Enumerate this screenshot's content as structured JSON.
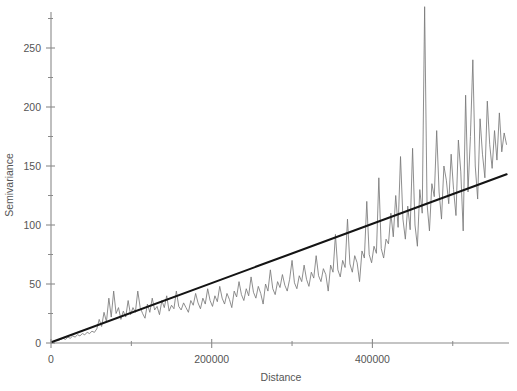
{
  "chart_data": {
    "type": "line",
    "title": "",
    "subtitle": "",
    "xlabel": "Distance",
    "ylabel": "Semivariance",
    "xlim": [
      0,
      570000
    ],
    "ylim": [
      0,
      285
    ],
    "grid": false,
    "legend_position": "none",
    "x_ticks_major": [
      0,
      200000,
      400000
    ],
    "x_tick_labels_major": [
      "0",
      "200000",
      "400000"
    ],
    "x_ticks_minor": [
      100000,
      300000,
      500000
    ],
    "y_ticks_major": [
      0,
      50,
      100,
      150,
      200,
      250
    ],
    "y_tick_labels_major": [
      "0",
      "50",
      "100",
      "150",
      "200",
      "250"
    ],
    "y_ticks_minor": [
      25,
      75,
      125,
      175,
      225,
      275
    ],
    "series": [
      {
        "name": "Empirical semivariogram",
        "type": "line",
        "color": "#7a7a7a",
        "x": [
          3000,
          6000,
          9000,
          12000,
          15000,
          18000,
          21000,
          24000,
          27000,
          30000,
          33000,
          36000,
          39000,
          42000,
          45000,
          48000,
          51000,
          54000,
          57000,
          60000,
          63000,
          66000,
          69000,
          72000,
          75000,
          78000,
          81000,
          84000,
          87000,
          90000,
          93000,
          96000,
          99000,
          102000,
          105000,
          108000,
          111000,
          114000,
          117000,
          120000,
          123000,
          126000,
          129000,
          132000,
          135000,
          138000,
          141000,
          144000,
          147000,
          150000,
          153000,
          156000,
          159000,
          162000,
          165000,
          168000,
          171000,
          174000,
          177000,
          180000,
          183000,
          186000,
          189000,
          192000,
          195000,
          198000,
          201000,
          204000,
          207000,
          210000,
          213000,
          216000,
          219000,
          222000,
          225000,
          228000,
          231000,
          234000,
          237000,
          240000,
          243000,
          246000,
          249000,
          252000,
          255000,
          258000,
          261000,
          264000,
          267000,
          270000,
          273000,
          276000,
          279000,
          282000,
          285000,
          288000,
          291000,
          294000,
          297000,
          300000,
          303000,
          306000,
          309000,
          312000,
          315000,
          318000,
          321000,
          324000,
          327000,
          330000,
          333000,
          336000,
          339000,
          342000,
          345000,
          348000,
          351000,
          354000,
          357000,
          360000,
          363000,
          366000,
          369000,
          372000,
          375000,
          378000,
          381000,
          384000,
          387000,
          390000,
          393000,
          396000,
          399000,
          402000,
          405000,
          408000,
          411000,
          414000,
          417000,
          420000,
          423000,
          426000,
          429000,
          432000,
          435000,
          438000,
          441000,
          444000,
          447000,
          450000,
          453000,
          456000,
          459000,
          462000,
          465000,
          468000,
          471000,
          474000,
          477000,
          480000,
          483000,
          486000,
          489000,
          492000,
          495000,
          498000,
          501000,
          504000,
          507000,
          510000,
          513000,
          516000,
          519000,
          522000,
          525000,
          528000,
          531000,
          534000,
          537000,
          540000,
          543000,
          546000,
          549000,
          552000,
          555000,
          558000,
          561000,
          564000,
          567000
        ],
        "y": [
          1,
          2,
          2,
          3,
          4,
          3,
          5,
          4,
          6,
          5,
          7,
          6,
          8,
          7,
          9,
          8,
          10,
          9,
          12,
          20,
          14,
          26,
          18,
          38,
          22,
          44,
          25,
          30,
          20,
          27,
          22,
          36,
          24,
          30,
          26,
          44,
          30,
          25,
          21,
          33,
          26,
          38,
          28,
          31,
          24,
          36,
          30,
          40,
          27,
          32,
          29,
          44,
          31,
          28,
          34,
          30,
          26,
          36,
          32,
          42,
          34,
          29,
          38,
          33,
          46,
          36,
          31,
          40,
          35,
          48,
          38,
          33,
          42,
          37,
          30,
          44,
          39,
          52,
          41,
          36,
          46,
          40,
          56,
          43,
          38,
          48,
          42,
          33,
          50,
          44,
          62,
          46,
          41,
          52,
          47,
          58,
          49,
          44,
          54,
          70,
          51,
          46,
          57,
          52,
          66,
          54,
          48,
          60,
          55,
          74,
          57,
          52,
          63,
          58,
          44,
          66,
          60,
          92,
          62,
          56,
          70,
          64,
          105,
          67,
          60,
          74,
          68,
          52,
          78,
          72,
          120,
          75,
          68,
          82,
          76,
          140,
          80,
          72,
          88,
          84,
          110,
          90,
          125,
          98,
          158,
          105,
          88,
          116,
          96,
          165,
          100,
          82,
          130,
          110,
          285,
          118,
          95,
          135,
          124,
          180,
          128,
          105,
          150,
          138,
          118,
          160,
          130,
          108,
          172,
          145,
          95,
          210,
          128,
          175,
          240,
          150,
          122,
          190,
          160,
          140,
          205,
          168,
          148,
          180,
          155,
          195,
          162,
          178,
          168
        ]
      },
      {
        "name": "Fitted linear model",
        "type": "line",
        "color": "#141414",
        "x": [
          2000,
          567000
        ],
        "y": [
          1,
          143
        ]
      }
    ],
    "annotations": [
      {
        "text": "peak maximum",
        "x": 435000,
        "y": 285
      }
    ]
  },
  "axes": {
    "x_title": "Distance",
    "y_title": "Semivariance"
  }
}
